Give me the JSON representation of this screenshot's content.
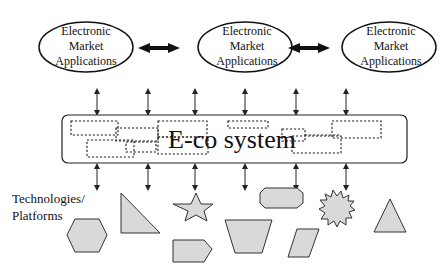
{
  "diagram": {
    "applications": [
      {
        "line1": "Electronic",
        "line2": "Market",
        "line3": "Applications"
      },
      {
        "line1": "Electronic",
        "line2": "Market",
        "line3": "Applications"
      },
      {
        "line1": "Electronic",
        "line2": "Market",
        "line3": "Applications"
      }
    ],
    "ecosystem": {
      "label": "E-co system"
    },
    "technologies": {
      "line1": "Technologies/",
      "line2": "Platforms"
    },
    "shapes": [
      "hexagon",
      "right-triangle",
      "star",
      "pentagon-arrow",
      "trapezoid",
      "octagon",
      "parallelogram",
      "starburst",
      "triangle"
    ],
    "colors": {
      "shape_fill": "#d9d9d9",
      "stroke": "#222222",
      "background": "#ffffff"
    }
  }
}
